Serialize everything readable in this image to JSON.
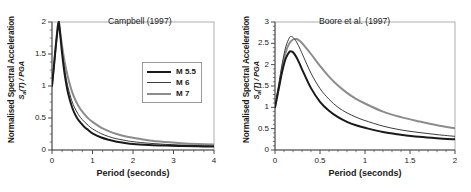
{
  "figure": {
    "background": "#ffffff",
    "panel_count": 2
  },
  "chart_data": [
    {
      "type": "line",
      "panel": "left",
      "title": "Campbell (1997)",
      "xlabel": "Period (seconds)",
      "ylabel": "Normalised Spectral Acceleration",
      "ylabel_sub": "Sa(T) / PGA",
      "xlim": [
        0,
        4
      ],
      "ylim": [
        0,
        2
      ],
      "xticks": [
        0,
        1,
        2,
        3,
        4
      ],
      "xtick_labels": [
        "0",
        "1",
        "2",
        "3",
        "4"
      ],
      "yticks": [
        0,
        0.5,
        1,
        1.5,
        2
      ],
      "ytick_labels": [
        "0",
        "0.5",
        "1",
        "1.5",
        "2"
      ],
      "xminor_count": 4,
      "yminor_count": 4,
      "grid": false,
      "legend_position": "upper-right-inside",
      "series": [
        {
          "name": "M 5.5",
          "color": "#1a1a1a",
          "width": 2.0,
          "x": [
            0,
            0.05,
            0.1,
            0.15,
            0.17,
            0.2,
            0.25,
            0.3,
            0.35,
            0.4,
            0.5,
            0.6,
            0.7,
            0.8,
            0.9,
            1.0,
            1.2,
            1.4,
            1.6,
            1.8,
            2.0,
            2.4,
            2.8,
            3.2,
            3.6,
            4.0
          ],
          "y": [
            1.0,
            1.32,
            1.66,
            1.96,
            2.0,
            1.82,
            1.5,
            1.24,
            1.04,
            0.88,
            0.66,
            0.52,
            0.43,
            0.36,
            0.31,
            0.26,
            0.2,
            0.16,
            0.13,
            0.11,
            0.095,
            0.08,
            0.07,
            0.063,
            0.057,
            0.053
          ]
        },
        {
          "name": "M 6",
          "color": "#3c3c3c",
          "width": 1.0,
          "x": [
            0,
            0.05,
            0.1,
            0.15,
            0.17,
            0.2,
            0.25,
            0.3,
            0.35,
            0.4,
            0.5,
            0.6,
            0.7,
            0.8,
            0.9,
            1.0,
            1.2,
            1.4,
            1.6,
            1.8,
            2.0,
            2.4,
            2.8,
            3.2,
            3.6,
            4.0
          ],
          "y": [
            1.0,
            1.33,
            1.67,
            1.97,
            2.0,
            1.84,
            1.55,
            1.31,
            1.12,
            0.97,
            0.75,
            0.61,
            0.51,
            0.44,
            0.38,
            0.33,
            0.26,
            0.21,
            0.175,
            0.15,
            0.13,
            0.105,
            0.088,
            0.077,
            0.069,
            0.063
          ]
        },
        {
          "name": "M 7",
          "color": "#8c8c8c",
          "width": 2.0,
          "x": [
            0,
            0.05,
            0.1,
            0.15,
            0.17,
            0.2,
            0.25,
            0.3,
            0.35,
            0.4,
            0.5,
            0.6,
            0.7,
            0.8,
            0.9,
            1.0,
            1.2,
            1.4,
            1.6,
            1.8,
            2.0,
            2.4,
            2.8,
            3.2,
            3.6,
            4.0
          ],
          "y": [
            1.0,
            1.34,
            1.68,
            1.98,
            2.0,
            1.86,
            1.62,
            1.42,
            1.26,
            1.12,
            0.9,
            0.75,
            0.64,
            0.56,
            0.49,
            0.44,
            0.355,
            0.295,
            0.25,
            0.215,
            0.19,
            0.15,
            0.125,
            0.107,
            0.094,
            0.085
          ]
        }
      ]
    },
    {
      "type": "line",
      "panel": "right",
      "title": "Boore et al. (1997)",
      "xlabel": "Period (seconds)",
      "ylabel": "Normalised Spectral Acceleration",
      "ylabel_sub": "Sa(T) / PGA",
      "xlim": [
        0,
        2
      ],
      "ylim": [
        0,
        3
      ],
      "xticks": [
        0,
        0.5,
        1,
        1.5,
        2
      ],
      "xtick_labels": [
        "0",
        "0.5",
        "1",
        "1.5",
        "2"
      ],
      "yticks": [
        0,
        0.5,
        1,
        1.5,
        2,
        2.5,
        3
      ],
      "ytick_labels": [
        "0",
        "0.5",
        "1",
        "1.5",
        "2",
        "2.5",
        "3"
      ],
      "xminor_count": 5,
      "yminor_count": 5,
      "grid": false,
      "legend_position": "none",
      "series": [
        {
          "name": "M 5.5",
          "color": "#1a1a1a",
          "width": 2.0,
          "x": [
            0,
            0.04,
            0.08,
            0.12,
            0.16,
            0.18,
            0.2,
            0.24,
            0.28,
            0.32,
            0.4,
            0.5,
            0.6,
            0.7,
            0.8,
            0.9,
            1.0,
            1.2,
            1.4,
            1.6,
            1.8,
            2.0
          ],
          "y": [
            1.0,
            1.42,
            1.84,
            2.15,
            2.3,
            2.31,
            2.29,
            2.17,
            1.99,
            1.8,
            1.45,
            1.13,
            0.92,
            0.77,
            0.66,
            0.58,
            0.52,
            0.42,
            0.36,
            0.31,
            0.275,
            0.25
          ]
        },
        {
          "name": "M 6",
          "color": "#3c3c3c",
          "width": 1.0,
          "x": [
            0,
            0.04,
            0.08,
            0.12,
            0.16,
            0.18,
            0.2,
            0.24,
            0.28,
            0.32,
            0.4,
            0.5,
            0.6,
            0.7,
            0.8,
            0.9,
            1.0,
            1.2,
            1.4,
            1.6,
            1.8,
            2.0
          ],
          "y": [
            1.0,
            1.5,
            2.02,
            2.42,
            2.63,
            2.66,
            2.64,
            2.53,
            2.36,
            2.17,
            1.8,
            1.44,
            1.19,
            1.0,
            0.87,
            0.77,
            0.69,
            0.56,
            0.47,
            0.41,
            0.36,
            0.32
          ]
        },
        {
          "name": "M 7",
          "color": "#8c8c8c",
          "width": 2.0,
          "x": [
            0,
            0.04,
            0.08,
            0.12,
            0.16,
            0.2,
            0.24,
            0.28,
            0.32,
            0.4,
            0.5,
            0.6,
            0.7,
            0.8,
            0.9,
            1.0,
            1.2,
            1.4,
            1.6,
            1.8,
            2.0
          ],
          "y": [
            1.0,
            1.46,
            1.94,
            2.3,
            2.5,
            2.59,
            2.6,
            2.55,
            2.46,
            2.25,
            1.97,
            1.72,
            1.51,
            1.34,
            1.2,
            1.09,
            0.9,
            0.77,
            0.67,
            0.58,
            0.51
          ]
        }
      ]
    }
  ],
  "legend": {
    "entries": [
      {
        "label": "M 5.5",
        "color": "#1a1a1a",
        "width": 2.2
      },
      {
        "label": "M 6",
        "color": "#3c3c3c",
        "width": 1.0
      },
      {
        "label": "M 7",
        "color": "#8c8c8c",
        "width": 2.2
      }
    ]
  }
}
